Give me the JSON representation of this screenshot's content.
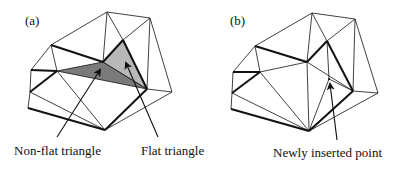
{
  "figure": {
    "panels": [
      {
        "id": "a",
        "tag": "(a)",
        "labels": {
          "non_flat": "Non-flat triangle",
          "flat": "Flat triangle"
        }
      },
      {
        "id": "b",
        "tag": "(b)",
        "labels": {
          "new_point": "Newly inserted point"
        }
      }
    ],
    "colors": {
      "line": "#111111",
      "non_flat_fill": "#7a7a7a",
      "flat_fill": "#b8b8b8",
      "background": "#ffffff"
    }
  }
}
